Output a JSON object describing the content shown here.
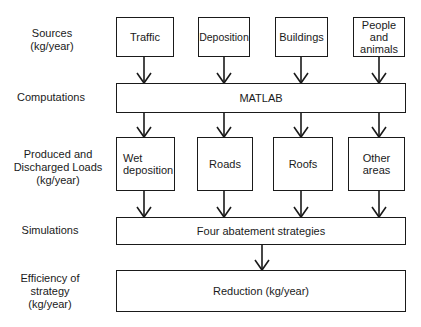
{
  "row_labels": {
    "sources": [
      "Sources",
      "(kg/year)"
    ],
    "computations": [
      "Computations"
    ],
    "loads": [
      "Produced and",
      "Discharged Loads",
      "(kg/year)"
    ],
    "simulations": [
      "Simulations"
    ],
    "efficiency": [
      "Efficiency of",
      "strategy",
      "(kg/year)"
    ]
  },
  "sources": [
    {
      "lines": [
        "Traffic"
      ]
    },
    {
      "lines": [
        "Deposition"
      ]
    },
    {
      "lines": [
        "Buildings"
      ]
    },
    {
      "lines": [
        "People",
        "and",
        "animals"
      ]
    }
  ],
  "computation": {
    "label": "MATLAB"
  },
  "loads": [
    {
      "lines": [
        "Wet",
        "deposition"
      ]
    },
    {
      "lines": [
        "Roads"
      ]
    },
    {
      "lines": [
        "Roofs"
      ]
    },
    {
      "lines": [
        "Other",
        "areas"
      ]
    }
  ],
  "simulation": {
    "label": "Four abatement strategies"
  },
  "result": {
    "label": "Reduction (kg/year)"
  }
}
